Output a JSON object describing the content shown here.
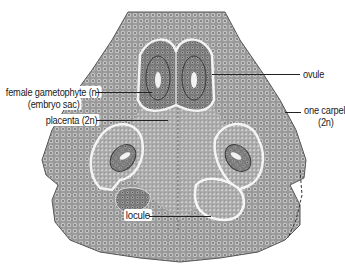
{
  "figure": {
    "colors": {
      "tissue_dark": "#5a5a5a",
      "tissue_mid": "#8c8c8c",
      "tissue_light": "#bdbdbd",
      "locule_outline": "#f2f2f2",
      "label_text": "#1a1a1a",
      "leader_line": "#222222"
    }
  },
  "labels": {
    "female_gametophyte_line1": "female gametophyte (n)",
    "female_gametophyte_line2": "(embryo sac)",
    "placenta": "placenta (2n)",
    "ovule": "ovule",
    "one_carpel_line1": "one carpel",
    "one_carpel_line2": "(2n)",
    "locule": "locule"
  }
}
